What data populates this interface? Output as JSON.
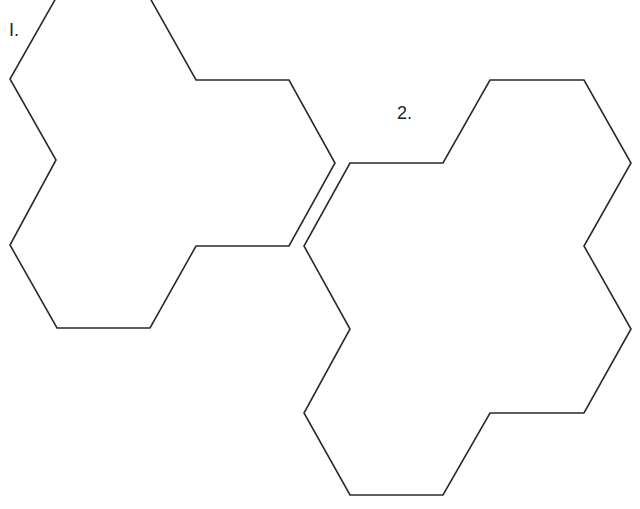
{
  "diagram": {
    "type": "polyhex-outlines",
    "stroke_color": "#2a2a2a",
    "background": "#ffffff",
    "shapes": [
      {
        "id": "shape-1",
        "label": "I.",
        "points": "56,-2 10,79 56,160 10,245 57,328 150,328 196,246 289,246 335,163 289,80 196,80 150,-2"
      },
      {
        "id": "shape-2",
        "label": "2.",
        "points": "350,163 443,163 490,80 584,80 631,163 584,246 631,329 584,413 490,413 443,495 350,495 304,413 350,329 304,246"
      }
    ]
  }
}
